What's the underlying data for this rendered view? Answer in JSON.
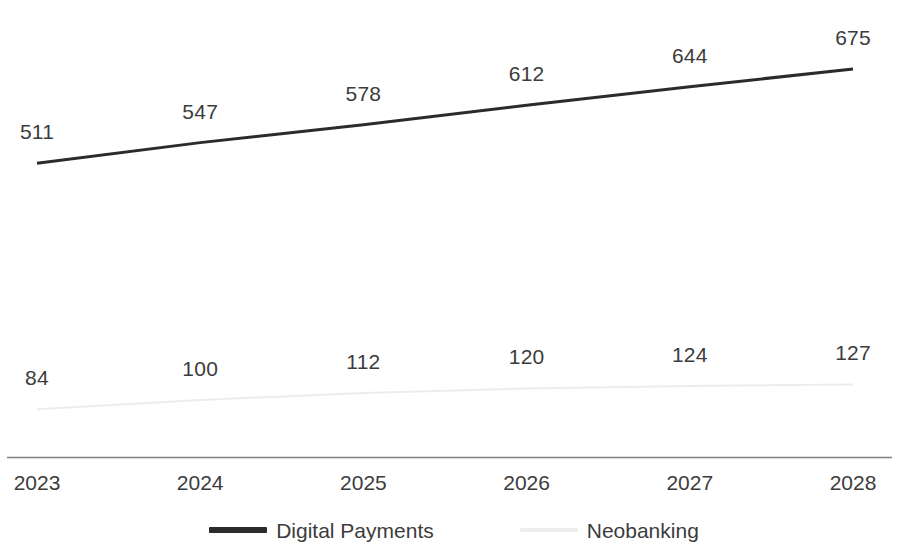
{
  "chart_data": {
    "type": "line",
    "title": "",
    "subtitle": "",
    "xlabel": "",
    "ylabel": "",
    "categories": [
      "2023",
      "2024",
      "2025",
      "2026",
      "2027",
      "2028"
    ],
    "series": [
      {
        "name": "Digital Payments",
        "color": "#2b2b2b",
        "line_width": 3,
        "values": [
          511,
          547,
          578,
          612,
          644,
          675
        ],
        "labels": [
          "511",
          "547",
          "578",
          "612",
          "644",
          "675"
        ]
      },
      {
        "name": "Neobanking",
        "color": "#ededed",
        "line_width": 2,
        "values": [
          84,
          100,
          112,
          120,
          124,
          127
        ],
        "labels": [
          "84",
          "100",
          "112",
          "120",
          "124",
          "127"
        ]
      }
    ],
    "ylim": [
      0,
      760
    ],
    "grid": false,
    "legend_position": "bottom",
    "axis_line_color": "#808080",
    "data_labels_shown": true
  },
  "axis": {
    "ticks": [
      "2023",
      "2024",
      "2025",
      "2026",
      "2027",
      "2028"
    ]
  },
  "legend": {
    "items": [
      {
        "label": "Digital Payments",
        "color": "#2b2b2b"
      },
      {
        "label": "Neobanking",
        "color": "#ededed"
      }
    ]
  }
}
